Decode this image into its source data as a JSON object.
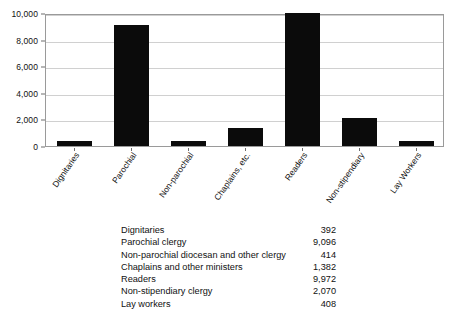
{
  "chart_data": {
    "type": "bar",
    "title": "",
    "xlabel": "",
    "ylabel": "",
    "categories": [
      "Dignitaries",
      "Parochial",
      "Non-parochial",
      "Chaplains, etc.",
      "Readers",
      "Non-stipendiary",
      "Lay Workers"
    ],
    "values": [
      392,
      9096,
      414,
      1382,
      9972,
      2070,
      408
    ],
    "ylim": [
      0,
      10000
    ],
    "yticks": [
      0,
      2000,
      4000,
      6000,
      8000,
      10000
    ],
    "ytick_labels": [
      "0",
      "2,000",
      "4,000",
      "6,000",
      "8,000",
      "10,000"
    ],
    "grid": true,
    "legend": "none",
    "bar_color": "#0b0b0b",
    "gridline_color": "#d0d0d0",
    "axis_color": "#9a9a9a"
  },
  "table": {
    "rows": [
      {
        "label": "Dignitaries",
        "value": "392"
      },
      {
        "label": "Parochial clergy",
        "value": "9,096"
      },
      {
        "label": "Non-parochial diocesan and other clergy",
        "value": "414"
      },
      {
        "label": "Chaplains and other ministers",
        "value": "1,382"
      },
      {
        "label": "Readers",
        "value": "9,972"
      },
      {
        "label": "Non-stipendiary clergy",
        "value": "2,070"
      },
      {
        "label": "Lay workers",
        "value": "408"
      }
    ]
  }
}
